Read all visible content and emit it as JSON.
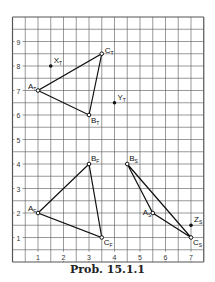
{
  "caption": "Prob. 15.1.1",
  "grid": {
    "x_min": 0,
    "x_max": 7.5,
    "y_min": 0,
    "y_max": 10,
    "minor_step": 0.5,
    "x_ticks": [
      "1",
      "2",
      "3",
      "4",
      "5",
      "6",
      "7"
    ],
    "y_ticks": [
      "1",
      "2",
      "3",
      "4",
      "5",
      "6",
      "7",
      "8",
      "9"
    ],
    "line_color": "#555555"
  },
  "triangles": [
    {
      "name": "T",
      "points": [
        {
          "label": "A",
          "sub": "T",
          "x": 1,
          "y": 7
        },
        {
          "label": "B",
          "sub": "T",
          "x": 3,
          "y": 6
        },
        {
          "label": "C",
          "sub": "T",
          "x": 3.5,
          "y": 8.5
        }
      ]
    },
    {
      "name": "F",
      "points": [
        {
          "label": "A",
          "sub": "F",
          "x": 1,
          "y": 2
        },
        {
          "label": "B",
          "sub": "F",
          "x": 3,
          "y": 4
        },
        {
          "label": "C",
          "sub": "F",
          "x": 3.5,
          "y": 1
        }
      ]
    },
    {
      "name": "S",
      "points": [
        {
          "label": "B",
          "sub": "S",
          "x": 4.5,
          "y": 4
        },
        {
          "label": "A",
          "sub": "S",
          "x": 5.5,
          "y": 2
        },
        {
          "label": "C",
          "sub": "S",
          "x": 7,
          "y": 1
        }
      ]
    }
  ],
  "points": [
    {
      "label": "X",
      "sub": "T",
      "x": 1.5,
      "y": 8
    },
    {
      "label": "Y",
      "sub": "T",
      "x": 4,
      "y": 6.5
    },
    {
      "label": "Z",
      "sub": "S",
      "x": 7,
      "y": 1.5
    }
  ]
}
